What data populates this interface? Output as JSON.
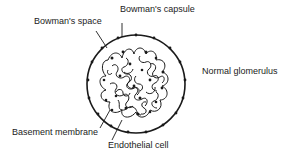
{
  "title": "Normal glomerulus",
  "labels": {
    "bowmans_space": "Bowman's space",
    "bowmans_capsule": "Bowman's capsule",
    "normal_glomerulus": "Normal glomerulus",
    "basement_membrane": "Basement membrane",
    "endothelial_cell": "Endothelial cell"
  },
  "colors": {
    "line": "#1a1a1a",
    "background": "#ffffff"
  }
}
